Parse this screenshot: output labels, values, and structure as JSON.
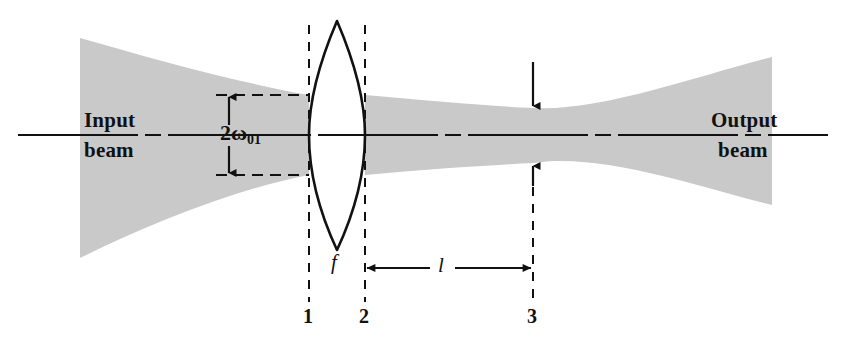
{
  "figure": {
    "type": "optics-ray-diagram",
    "background_color": "#ffffff",
    "beam_fill_color": "#c9c9c9",
    "line_color": "#111111"
  },
  "labels": {
    "input_beam_line1": "Input",
    "input_beam_line2": "beam",
    "output_beam_line1": "Output",
    "output_beam_line2": "beam",
    "waist_dimension": "2ω",
    "waist_dimension_subscript": "01",
    "focal_length": "f",
    "distance": "l",
    "plane_1": "1",
    "plane_2": "2",
    "plane_3": "3"
  },
  "geometry": {
    "optical_axis_y": 135,
    "axis_x_start": 18,
    "axis_x_end": 828,
    "plane_1_x": 309,
    "plane_2_x": 365,
    "plane_3_x": 533,
    "lens_center_x": 337,
    "lens_top_y": 21,
    "lens_bottom_y": 250,
    "input_beam_left_x": 80,
    "input_beam_left_top_y": 38,
    "input_beam_left_bottom_y": 258,
    "input_beam_at_lens_top_y": 95,
    "input_beam_at_lens_bottom_y": 175,
    "waist_top_y": 108,
    "waist_bottom_y": 163,
    "output_beam_right_x": 772,
    "output_beam_right_top_y": 57,
    "output_beam_right_bottom_y": 205,
    "dimension_line_y": 268,
    "waist_arrow_top_y": 62,
    "waist_arrow_bottom_y": 185
  }
}
